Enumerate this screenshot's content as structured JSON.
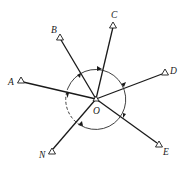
{
  "diagram": {
    "type": "survey-direction-observation",
    "center": {
      "label": "O"
    },
    "stations": [
      {
        "id": "A",
        "label": "A"
      },
      {
        "id": "B",
        "label": "B"
      },
      {
        "id": "C",
        "label": "C"
      },
      {
        "id": "D",
        "label": "D"
      },
      {
        "id": "E",
        "label": "E"
      },
      {
        "id": "N",
        "label": "N"
      }
    ],
    "observation_circle": {
      "direction": "clockwise",
      "solid_segment": "N → A → B → C → D → E → N",
      "dashed_segment": "A ← N (closing)"
    },
    "colors": {
      "line": "#1a1a1a",
      "background": "#ffffff"
    }
  }
}
